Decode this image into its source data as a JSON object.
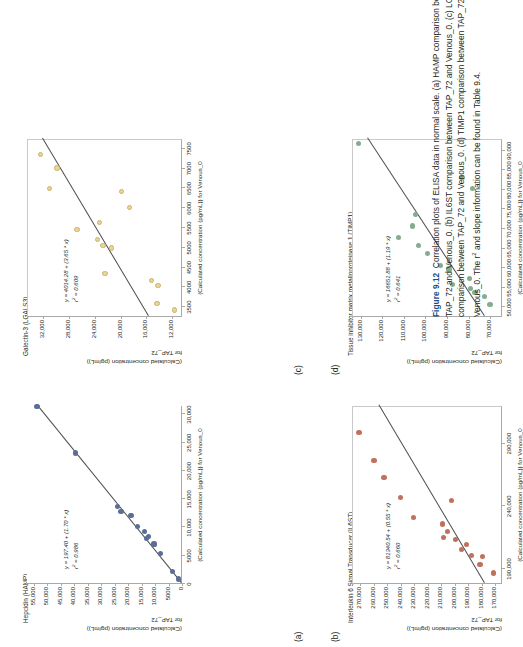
{
  "figure": {
    "number": "Figure 9.12",
    "caption_text": "Correlation plots of ELISA data in normal scale. (a) HAMP comparison between TAP_72 and Venous_0. (b) IL6ST comparison between TAP_72 and Venous_0. (c) LGALS3 comparison between TAP_72 and Venous_0. (d) TIMP1 comparison between TAP_72 and Venous_0. The r",
    "caption_sup": "2",
    "caption_tail": " and slope information can be found in Table 9.4."
  },
  "axis_titles": {
    "y_line1": "(Calculated concentration (pg/mL))",
    "y_line2": "for TAP_72",
    "x_line": "(Calculated concentration (pg/mL)) for Venous_0"
  },
  "colors": {
    "hamp": "#5a6e96",
    "il6st": "#c0715c",
    "lgals3": "#e8d59a",
    "timp1": "#86ac8e",
    "fitline": "#4d4d4d",
    "axis": "#a9a9a9",
    "text": "#231f20",
    "fignum": "#1a4f8a"
  },
  "chart_data": [
    {
      "panel": "a",
      "letter": "(a)",
      "type": "scatter",
      "title": "Hepcidin (HAMP)",
      "equation": "y = 197.40 + (1.70 * x)",
      "r2": "r2 = 0.986",
      "r2_value": 0.986,
      "intercept": 197.4,
      "slope": 1.7,
      "xlabel": "(Calculated concentration (pg/mL)) for Venous_0",
      "ylabel": "(Calculated concentration (pg/mL)) for TAP_72",
      "xticks": [
        "0",
        "5000",
        "10,000",
        "15,000",
        "20,000",
        "25,000",
        "30,000"
      ],
      "xtick_values": [
        0,
        5000,
        10000,
        15000,
        20000,
        25000,
        30000
      ],
      "yticks": [
        "0",
        "5000",
        "10,000",
        "15,000",
        "20,000",
        "25,000",
        "30,000",
        "35,000",
        "40,000",
        "45,000",
        "50,000",
        "55,000"
      ],
      "ytick_values": [
        0,
        5000,
        10000,
        15000,
        20000,
        25000,
        30000,
        35000,
        40000,
        45000,
        50000,
        55000
      ],
      "xlim": [
        0,
        31500
      ],
      "ylim": [
        0,
        57500
      ],
      "points": [
        {
          "x": 700,
          "y": 1400
        },
        {
          "x": 2100,
          "y": 3600
        },
        {
          "x": 5200,
          "y": 7900
        },
        {
          "x": 6900,
          "y": 10400
        },
        {
          "x": 7900,
          "y": 13200
        },
        {
          "x": 8300,
          "y": 12400
        },
        {
          "x": 9100,
          "y": 14000
        },
        {
          "x": 10000,
          "y": 16400
        },
        {
          "x": 11900,
          "y": 18900
        },
        {
          "x": 12600,
          "y": 22600
        },
        {
          "x": 13500,
          "y": 23900
        },
        {
          "x": 23000,
          "y": 39500
        },
        {
          "x": 31200,
          "y": 53800
        }
      ],
      "fit": {
        "x0": 0,
        "y0": 197,
        "x1": 31500,
        "y1": 53747
      }
    },
    {
      "panel": "b",
      "letter": "(b)",
      "type": "scatter",
      "title": "Interleukin 6 Signal Transducer (IL6ST)",
      "equation": "y = 81340.54 + (0.55 * x)",
      "r2": "r2 = 0.660",
      "r2_value": 0.66,
      "intercept": 81340.54,
      "slope": 0.55,
      "xlabel": "(Calculated concentration (pg/mL)) for Venous_0",
      "ylabel": "(Calculated concentration (pg/mL)) for TAP_72",
      "xticks": [
        "190,000",
        "240,000",
        "290,000"
      ],
      "xtick_values": [
        190000,
        240000,
        290000
      ],
      "yticks": [
        "170,000",
        "180,000",
        "190,000",
        "200,000",
        "210,000",
        "220,000",
        "230,000",
        "240,000",
        "250,000",
        "260,000",
        "270,000"
      ],
      "ytick_values": [
        170000,
        180000,
        190000,
        200000,
        210000,
        220000,
        230000,
        240000,
        250000,
        260000,
        270000
      ],
      "xlim": [
        178000,
        320000
      ],
      "ylim": [
        165000,
        276000
      ],
      "points": [
        {
          "x": 186000,
          "y": 172000
        },
        {
          "x": 193000,
          "y": 182000
        },
        {
          "x": 199000,
          "y": 180000
        },
        {
          "x": 200000,
          "y": 188500
        },
        {
          "x": 205000,
          "y": 195500
        },
        {
          "x": 209000,
          "y": 192000
        },
        {
          "x": 213000,
          "y": 200000
        },
        {
          "x": 214000,
          "y": 209000
        },
        {
          "x": 219000,
          "y": 206000
        },
        {
          "x": 225000,
          "y": 210000
        },
        {
          "x": 230000,
          "y": 231500
        },
        {
          "x": 244000,
          "y": 203000
        },
        {
          "x": 246000,
          "y": 241000
        },
        {
          "x": 262000,
          "y": 253000
        },
        {
          "x": 276000,
          "y": 260500
        },
        {
          "x": 298000,
          "y": 271500
        }
      ],
      "fit": {
        "x0": 178000,
        "y0": 179230,
        "x1": 320000,
        "y1": 257340
      }
    },
    {
      "panel": "c",
      "letter": "(c)",
      "type": "scatter",
      "title": "Galectin-3 (LGALS3)",
      "equation": "y = 4014.28 + (3.65 * x)",
      "r2": "r2 = 0.609",
      "r2_value": 0.609,
      "intercept": 4014.28,
      "slope": 3.65,
      "xlabel": "(Calculated concentration (pg/mL)) for Venous_0",
      "ylabel": "(Calculated concentration (pg/mL)) for TAP_72",
      "xticks": [
        "3500",
        "4000",
        "4500",
        "5000",
        "5500",
        "6000",
        "6500",
        "7000",
        "7500"
      ],
      "xtick_values": [
        3500,
        4000,
        4500,
        5000,
        5500,
        6000,
        6500,
        7000,
        7500
      ],
      "yticks": [
        "12,000",
        "16,000",
        "20,000",
        "24,000",
        "28,000",
        "32,000"
      ],
      "ytick_values": [
        12000,
        16000,
        20000,
        24000,
        28000,
        32000
      ],
      "xlim": [
        3250,
        7750
      ],
      "ylim": [
        10500,
        34500
      ],
      "points": [
        {
          "x": 3400,
          "y": 11800
        },
        {
          "x": 3560,
          "y": 14500
        },
        {
          "x": 4020,
          "y": 14400
        },
        {
          "x": 4140,
          "y": 15400
        },
        {
          "x": 4320,
          "y": 22600
        },
        {
          "x": 4970,
          "y": 21600
        },
        {
          "x": 5030,
          "y": 22900
        },
        {
          "x": 5180,
          "y": 23700
        },
        {
          "x": 5440,
          "y": 26900
        },
        {
          "x": 5620,
          "y": 23400
        },
        {
          "x": 6000,
          "y": 18800
        },
        {
          "x": 6400,
          "y": 20000
        },
        {
          "x": 6480,
          "y": 31200
        },
        {
          "x": 6990,
          "y": 30000
        },
        {
          "x": 7330,
          "y": 32600
        }
      ],
      "fit": {
        "x0": 3250,
        "y0": 15877,
        "x1": 7750,
        "y1": 32302
      }
    },
    {
      "panel": "d",
      "letter": "(d)",
      "type": "scatter",
      "title": "Tissue inhibitor matrix metalloproteinase 1 (TIMP1)",
      "equation": "y = 16651.88 + (1.19 * x)",
      "r2": "r2 = 0.641",
      "r2_value": 0.641,
      "intercept": 16651.88,
      "slope": 1.19,
      "xlabel": "(Calculated concentration (pg/mL)) for Venous_0",
      "ylabel": "(Calculated concentration (pg/mL)) for TAP_72",
      "xticks": [
        "50,000",
        "55,000",
        "60,000",
        "65,000",
        "70,000",
        "75,000",
        "80,000",
        "85,000",
        "90,000"
      ],
      "xtick_values": [
        50000,
        55000,
        60000,
        65000,
        70000,
        75000,
        80000,
        85000,
        90000
      ],
      "yticks": [
        "70,000",
        "80,000",
        "90,000",
        "100,000",
        "110,000",
        "120,000",
        "130,000"
      ],
      "ytick_values": [
        70000,
        80000,
        90000,
        100000,
        110000,
        120000,
        130000
      ],
      "xlim": [
        47500,
        93000
      ],
      "ylim": [
        64500,
        134000
      ],
      "points": [
        {
          "x": 50500,
          "y": 70500
        },
        {
          "x": 52500,
          "y": 73000
        },
        {
          "x": 53500,
          "y": 77500
        },
        {
          "x": 54500,
          "y": 79500
        },
        {
          "x": 55500,
          "y": 88000
        },
        {
          "x": 57000,
          "y": 80000
        },
        {
          "x": 59500,
          "y": 89500
        },
        {
          "x": 60500,
          "y": 93500
        },
        {
          "x": 63500,
          "y": 99500
        },
        {
          "x": 65500,
          "y": 103500
        },
        {
          "x": 67500,
          "y": 113000
        },
        {
          "x": 70500,
          "y": 106500
        },
        {
          "x": 73500,
          "y": 105000
        },
        {
          "x": 80000,
          "y": 78500
        },
        {
          "x": 83000,
          "y": 83500
        },
        {
          "x": 91500,
          "y": 131500
        }
      ],
      "fit": {
        "x0": 47500,
        "y0": 73177,
        "x1": 93000,
        "y1": 127322
      }
    }
  ]
}
